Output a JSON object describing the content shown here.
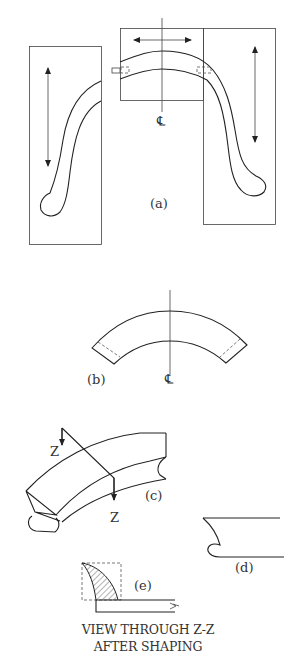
{
  "figure": {
    "panels": {
      "a": {
        "label": "(a)",
        "description": "Strip bent into S-shaped arch inside three forming boxes with motion arrows"
      },
      "b": {
        "label": "(b)",
        "description": "Curved arc segment with centerline and dashed end lines"
      },
      "c": {
        "label": "(c)",
        "description": "Isometric view of curved section with section cut Z-Z"
      },
      "d": {
        "label": "(d)",
        "description": "End profile with curled edge"
      },
      "e": {
        "label": "(e)",
        "description": "Hatched cross-section inside dashed box"
      }
    },
    "centerline_symbol": "℄",
    "section_marker": "Z",
    "caption_line1": "VIEW THROUGH Z-Z",
    "caption_line2": "AFTER SHAPING"
  },
  "colors": {
    "background": "#ffffff",
    "stroke": "#222222",
    "text": "#333333"
  }
}
